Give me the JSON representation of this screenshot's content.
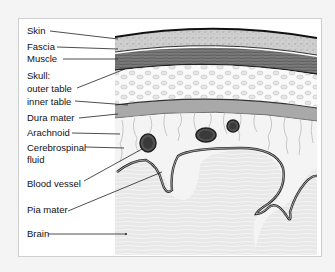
{
  "diagram": {
    "labels": [
      {
        "id": "skin",
        "text": "Skin"
      },
      {
        "id": "fascia",
        "text": "Fascia"
      },
      {
        "id": "muscle",
        "text": "Muscle"
      },
      {
        "id": "skull",
        "text": "Skull:"
      },
      {
        "id": "outer_table",
        "text": "outer table"
      },
      {
        "id": "inner_table",
        "text": "inner table"
      },
      {
        "id": "dura_mater",
        "text": "Dura mater"
      },
      {
        "id": "arachnoid",
        "text": "Arachnoid"
      },
      {
        "id": "csf_1",
        "text": "Cerebrospinal"
      },
      {
        "id": "csf_2",
        "text": "fluid"
      },
      {
        "id": "blood_vessel",
        "text": "Blood vessel"
      },
      {
        "id": "pia_mater",
        "text": "Pia mater"
      },
      {
        "id": "brain",
        "text": "Brain"
      }
    ],
    "colors": {
      "frame_bg": "#ffffff",
      "page_bg": "#f4f4f4",
      "skin": "#c9c9c9",
      "muscle": "#6e6e6e",
      "bone": "#ededed",
      "dura": "#9a9a9a",
      "csf": "#f2f2f2",
      "brain": "#e2e2e2",
      "line": "#222222"
    }
  }
}
